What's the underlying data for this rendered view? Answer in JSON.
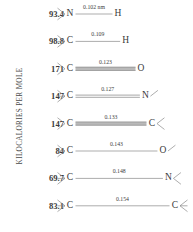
{
  "figure": {
    "axis_label": "KILOCALORIES PER MOLE",
    "units_note": "nm",
    "width": 193,
    "height": 232,
    "background_color": "#ffffff",
    "text_color": "#3a3a3a",
    "bond_color": "#8a8a8a"
  },
  "chart_data": {
    "type": "table",
    "title": "",
    "subtitle": "",
    "xlabel": "",
    "ylabel": "KILOCALORIES PER MOLE",
    "grid": false,
    "legend": "none",
    "columns": [
      "Bond energy (kcal/mol)",
      "Left atom",
      "Bond length (nm)",
      "Bond order",
      "Right atom"
    ],
    "categories": [
      "N-H",
      "C-H",
      "C=O",
      "C=N",
      "C=C",
      "C-O",
      "C-N",
      "C-C"
    ],
    "values": [
      93.4,
      98.8,
      171,
      147,
      147,
      84,
      69.7,
      83.1
    ],
    "bond_lengths": [
      0.102,
      0.109,
      0.123,
      0.127,
      0.133,
      0.143,
      0.148,
      0.154
    ],
    "rows": [
      {
        "energy": "93.4",
        "left_atom": "N",
        "right_atom": "H",
        "length_label": "0.102 nm",
        "bond_order": 1,
        "left_stubs": 2,
        "right_stubs": 0
      },
      {
        "energy": "98.8",
        "left_atom": "C",
        "right_atom": "H",
        "length_label": "0.109",
        "bond_order": 1,
        "left_stubs": 3,
        "right_stubs": 0
      },
      {
        "energy": "171",
        "left_atom": "C",
        "right_atom": "O",
        "length_label": "0.123",
        "bond_order": 3,
        "left_stubs": 2,
        "right_stubs": 0
      },
      {
        "energy": "147",
        "left_atom": "C",
        "right_atom": "N",
        "length_label": "0.127",
        "bond_order": 2,
        "left_stubs": 3,
        "right_stubs": 1
      },
      {
        "energy": "147",
        "left_atom": "C",
        "right_atom": "C",
        "length_label": "0.133",
        "bond_order": 3,
        "left_stubs": 2,
        "right_stubs": 2
      },
      {
        "energy": "84",
        "left_atom": "C",
        "right_atom": "O",
        "length_label": "0.143",
        "bond_order": 1,
        "left_stubs": 3,
        "right_stubs": 1
      },
      {
        "energy": "69.7",
        "left_atom": "C",
        "right_atom": "N",
        "length_label": "0.148",
        "bond_order": 1,
        "left_stubs": 3,
        "right_stubs": 2
      },
      {
        "energy": "83.1",
        "left_atom": "C",
        "right_atom": "C",
        "length_label": "0.154",
        "bond_order": 1,
        "left_stubs": 3,
        "right_stubs": 3
      }
    ]
  }
}
